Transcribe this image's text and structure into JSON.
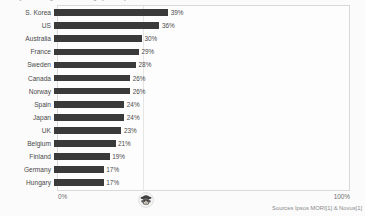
{
  "chart_data": {
    "type": "bar",
    "orientation": "horizontal",
    "title": "Survey: Belief in ghosts / haunting by country",
    "categories": [
      "S. Korea",
      "US",
      "Australia",
      "France",
      "Sweden",
      "Canada",
      "Norway",
      "Spain",
      "Japan",
      "UK",
      "Belgium",
      "Finland",
      "Germany",
      "Hungary"
    ],
    "values": [
      39,
      36,
      30,
      29,
      28,
      26,
      26,
      24,
      24,
      23,
      21,
      19,
      17,
      17
    ],
    "value_labels": [
      "39%",
      "36%",
      "30%",
      "29%",
      "28%",
      "26%",
      "26%",
      "24%",
      "24%",
      "23%",
      "21%",
      "19%",
      "17%",
      "17%"
    ],
    "xlabel": "",
    "ylabel": "",
    "xlim": [
      0,
      100
    ],
    "xtick_labels": [
      "0%",
      "100%"
    ],
    "grid": true,
    "gridline_values": [
      29
    ],
    "legend": null,
    "bar_color": "#3a3a3a",
    "background_color": "#fdfdfd",
    "source_note": "Sources Ipsos MORI[1] & Novus[1]"
  },
  "axis": {
    "min_label": "0%",
    "max_label": "100%"
  },
  "footer": {
    "source": "Sources Ipsos MORI[1] & Novus[1]",
    "logo_name": "monkey-face-logo"
  }
}
